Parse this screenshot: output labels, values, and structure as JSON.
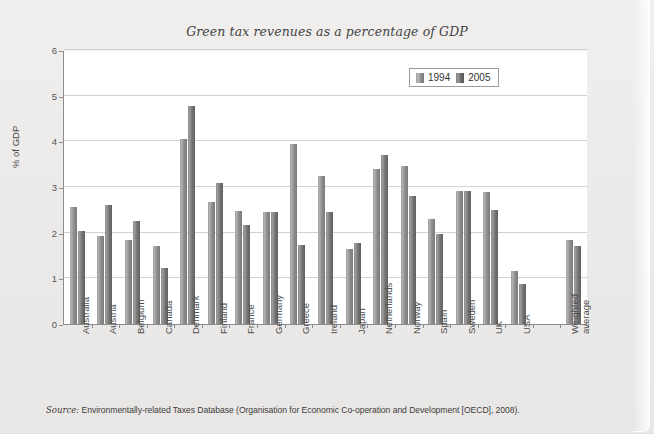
{
  "figure": {
    "title": "Green tax revenues as a percentage of GDP",
    "source_label": "Source:",
    "source_text": " Environmentally-related Taxes Database (Organisation for Economic Co-operation and Development [OECD], 2008)."
  },
  "legend": {
    "items": [
      {
        "label": "1994",
        "color": "#9a9a9a"
      },
      {
        "label": "2005",
        "color": "#6d6d6d"
      }
    ]
  },
  "colors": {
    "page_background": "#edecea",
    "plot_background": "#ffffff",
    "axis": "#8d8d8d",
    "gridline": "#d2d2d2",
    "series_1994": "#9a9a9a",
    "series_2005": "#6d6d6d"
  },
  "chart_data": {
    "type": "bar",
    "title": "Green tax revenues as a percentage of GDP",
    "xlabel": "",
    "ylabel": "% of GDP",
    "ylim": [
      0,
      6
    ],
    "yticks": [
      0,
      1,
      2,
      3,
      4,
      5,
      6
    ],
    "ytick_labels": [
      "0",
      "1",
      "2",
      "3",
      "4",
      "5",
      "6"
    ],
    "grid": true,
    "legend_position": "top-right",
    "categories": [
      "Australia",
      "Austria",
      "Belgium",
      "Canada",
      "Denmark",
      "Finland",
      "France",
      "Germany",
      "Greece",
      "Ireland",
      "Japan",
      "Netherlands",
      "Norway",
      "Spain",
      "Sweden",
      "UK",
      "USA",
      "",
      "Weighted average"
    ],
    "series": [
      {
        "name": "1994",
        "values": [
          2.57,
          1.93,
          1.85,
          1.7,
          4.05,
          2.68,
          2.47,
          2.45,
          3.95,
          3.25,
          1.65,
          3.4,
          3.45,
          2.3,
          2.92,
          2.9,
          1.17,
          null,
          1.83
        ]
      },
      {
        "name": "2005",
        "values": [
          2.03,
          2.6,
          2.26,
          1.22,
          4.78,
          3.08,
          2.17,
          2.45,
          1.72,
          2.46,
          1.77,
          3.7,
          2.8,
          1.98,
          2.92,
          2.5,
          0.88,
          null,
          1.7
        ]
      }
    ]
  }
}
